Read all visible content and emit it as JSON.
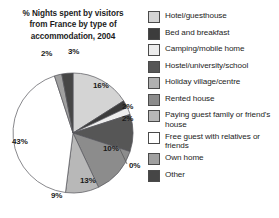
{
  "chart_data": {
    "type": "pie",
    "title": "% Nights spent by visitors from France by type of accommodation, 2004",
    "xlabel": "",
    "ylabel": "",
    "legend_position": "right",
    "units": "percent",
    "categories": [
      "Hotel/guesthouse",
      "Bed and breakfast",
      "Camping/mobile home",
      "Hostel/university/school",
      "Holiday village/centre",
      "Rented house",
      "Paying guest family or friend's house",
      "Free guest with relatives or friends",
      "Own home",
      "Other"
    ],
    "values": [
      16,
      2,
      2,
      10,
      0,
      13,
      9,
      43,
      2,
      3
    ],
    "value_labels": [
      "16%",
      "2%",
      "2%",
      "10%",
      "0%",
      "13%",
      "9%",
      "43%",
      "2%",
      "3%"
    ],
    "colors": [
      "#d4d4d4",
      "#3c3c3c",
      "#ededed",
      "#565656",
      "#b0b0b0",
      "#8c8c8c",
      "#b8b8b8",
      "#ffffff",
      "#a0a0a0",
      "#464646"
    ]
  },
  "title": {
    "line1": "% Nights spent by visitors",
    "line2": "from France by type of",
    "line3": "accommodation, 2004",
    "full": "% Nights spent by visitors from France by type of accommodation, 2004"
  },
  "legend": {
    "items": [
      {
        "label": "Hotel/guesthouse",
        "color": "#d4d4d4",
        "value": "16%"
      },
      {
        "label": "Bed and breakfast",
        "color": "#3c3c3c",
        "value": "2%"
      },
      {
        "label": "Camping/mobile home",
        "color": "#ededed",
        "value": "2%"
      },
      {
        "label": "Hostel/university/school",
        "color": "#565656",
        "value": "10%"
      },
      {
        "label": "Holiday village/centre",
        "color": "#b0b0b0",
        "value": "0%"
      },
      {
        "label": "Rented house",
        "color": "#8c8c8c",
        "value": "13%"
      },
      {
        "label": "Paying guest family or friend's house",
        "color": "#b8b8b8",
        "value": "9%"
      },
      {
        "label": "Free guest with relatives or friends",
        "color": "#ffffff",
        "value": "43%"
      },
      {
        "label": "Own home",
        "color": "#a0a0a0",
        "value": "2%"
      },
      {
        "label": "Other",
        "color": "#464646",
        "value": "3%"
      }
    ]
  },
  "pie_labels": [
    {
      "text": "3%",
      "left": 68,
      "top": 7
    },
    {
      "text": "16%",
      "left": 93,
      "top": 41
    },
    {
      "text": "2%",
      "left": 122,
      "top": 62
    },
    {
      "text": "2%",
      "left": 122,
      "top": 74
    },
    {
      "text": "10%",
      "left": 103,
      "top": 104
    },
    {
      "text": "0%",
      "left": 129,
      "top": 121
    },
    {
      "text": "13%",
      "left": 80,
      "top": 136
    },
    {
      "text": "9%",
      "left": 51,
      "top": 151
    },
    {
      "text": "43%",
      "left": 12,
      "top": 97
    },
    {
      "text": "2%",
      "left": 41,
      "top": 9
    }
  ]
}
